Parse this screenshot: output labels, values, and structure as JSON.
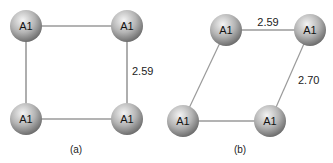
{
  "panels": [
    {
      "caption": "(a)",
      "atoms": [
        {
          "label": "A1",
          "x": 26,
          "y": 26
        },
        {
          "label": "A1",
          "x": 127,
          "y": 26
        },
        {
          "label": "A1",
          "x": 26,
          "y": 119
        },
        {
          "label": "A1",
          "x": 127,
          "y": 119
        }
      ],
      "bond_label": "2.59"
    },
    {
      "caption": "(b)",
      "atoms": [
        {
          "label": "A1",
          "x": 226,
          "y": 30
        },
        {
          "label": "A1",
          "x": 310,
          "y": 30
        },
        {
          "label": "A1",
          "x": 183,
          "y": 121
        },
        {
          "label": "A1",
          "x": 270,
          "y": 121
        }
      ],
      "bond_label_top": "2.59",
      "bond_label_side": "2.70"
    }
  ],
  "colors": {
    "bond": "#9a9a9a",
    "sphere_light": "#f2f2f2",
    "sphere_dark": "#6e6e6e"
  }
}
